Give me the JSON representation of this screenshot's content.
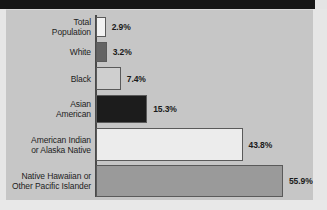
{
  "figure": {
    "background_color": "#c6c6c6",
    "axis_color": "#4a4a4a",
    "top_band_color": "#161616",
    "value_suffix": "%"
  },
  "chart_data": {
    "type": "bar",
    "orientation": "horizontal",
    "title": "",
    "xlabel": "",
    "ylabel": "",
    "grid": false,
    "legend": "none",
    "xlim": [
      0,
      60
    ],
    "categories": [
      "Total\nPopulation",
      "White",
      "Black",
      "Asian\nAmerican",
      "American Indian\nor Alaska Native",
      "Native Hawaiian or\nOther Pacific Islander"
    ],
    "values": [
      2.9,
      3.2,
      7.4,
      15.3,
      43.8,
      55.9
    ],
    "value_labels": [
      "2.9%",
      "3.2%",
      "7.4%",
      "15.3%",
      "43.8%",
      "55.9%"
    ],
    "bar_colors": [
      "#f2f2f2",
      "#636363",
      "#cfcfcf",
      "#1c1c1c",
      "#ececec",
      "#9a9a9a"
    ]
  }
}
